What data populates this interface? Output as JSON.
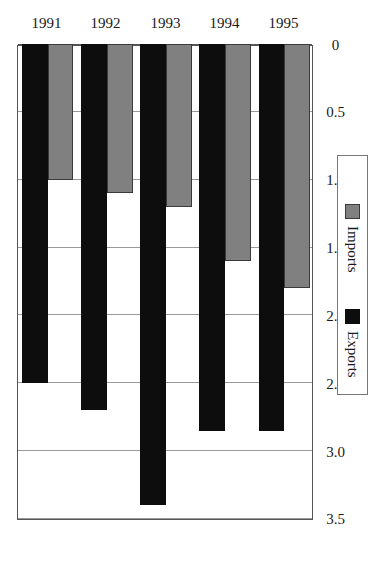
{
  "chart_data": {
    "type": "bar",
    "orientation": "horizontal",
    "title": "",
    "subtitle": "",
    "xlabel": "",
    "ylabel": "",
    "categories": [
      "1991",
      "1992",
      "1993",
      "1994",
      "1995"
    ],
    "series": [
      {
        "name": "Exports",
        "color": "#0d0d0d",
        "values": [
          2.5,
          2.7,
          3.4,
          2.85,
          2.85
        ]
      },
      {
        "name": "Imports",
        "color": "#808080",
        "values": [
          1.0,
          1.1,
          1.2,
          1.6,
          1.8
        ]
      }
    ],
    "value_axis": {
      "min": 0,
      "max": 3.5,
      "ticks": [
        0,
        0.5,
        1.0,
        1.5,
        2.0,
        2.5,
        3.0,
        3.5
      ],
      "tick_labels": [
        "0",
        "0.5",
        "1.0",
        "1.5",
        "2.0",
        "2.5",
        "3.0",
        "3.5"
      ],
      "reversed": true
    },
    "grid": {
      "value_axis": true,
      "category_axis": false
    },
    "legend": {
      "position": "right",
      "entries": [
        {
          "label": "Imports",
          "swatch": "imports"
        },
        {
          "label": "Exports",
          "swatch": "exports"
        }
      ]
    },
    "rotation_deg": -90
  },
  "legend": {
    "imports_label": "Imports",
    "exports_label": "Exports"
  },
  "colors": {
    "exports": "#0d0d0d",
    "imports": "#808080",
    "grid": "#9a9a9a",
    "frame": "#555555",
    "background": "#ffffff"
  }
}
